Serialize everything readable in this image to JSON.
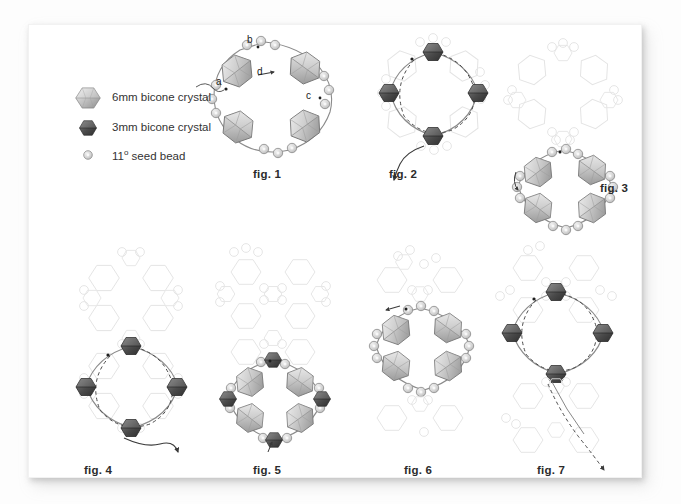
{
  "page": {
    "background_color": "#fdfdfd",
    "sheet_color": "#ffffff"
  },
  "legend": {
    "items": [
      {
        "icon": "bicone-crystal-6mm-icon",
        "label": "6mm bicone crystal",
        "color": "#9a9a9a",
        "size": "6mm"
      },
      {
        "icon": "bicone-crystal-3mm-icon",
        "label": "3mm bicone crystal",
        "color": "#4a4a4a",
        "size": "3mm"
      },
      {
        "icon": "seed-bead-icon",
        "label_prefix": "11",
        "label_sup": "o",
        "label_suffix": " seed bead",
        "label": "11º seed bead",
        "color": "#c9c9c9",
        "size": "11/0"
      }
    ]
  },
  "figures": [
    {
      "id": "fig1",
      "label": "fig. 1",
      "points": [
        {
          "name": "a",
          "text": "a"
        },
        {
          "name": "b",
          "text": "b"
        },
        {
          "name": "c",
          "text": "c"
        },
        {
          "name": "d",
          "text": "d"
        }
      ],
      "crystals_6mm": 4,
      "crystals_3mm": 0,
      "seed_beads": 12,
      "ghost_rounds": 0
    },
    {
      "id": "fig2",
      "label": "fig. 2",
      "points": [],
      "crystals_6mm": 0,
      "crystals_3mm": 4,
      "seed_beads": 0,
      "ghost_rounds": 1
    },
    {
      "id": "fig3",
      "label": "fig. 3",
      "points": [],
      "crystals_6mm": 4,
      "crystals_3mm": 0,
      "seed_beads": 12,
      "ghost_rounds": 2
    },
    {
      "id": "fig4",
      "label": "fig. 4",
      "points": [],
      "crystals_6mm": 0,
      "crystals_3mm": 4,
      "seed_beads": 0,
      "ghost_rounds": 3
    },
    {
      "id": "fig5",
      "label": "fig. 5",
      "points": [],
      "crystals_6mm": 4,
      "crystals_3mm": 4,
      "seed_beads": 12,
      "ghost_rounds": 4
    },
    {
      "id": "fig6",
      "label": "fig. 6",
      "points": [],
      "crystals_6mm": 4,
      "crystals_3mm": 0,
      "seed_beads": 12,
      "ghost_rounds": 5
    },
    {
      "id": "fig7",
      "label": "fig. 7",
      "points": [],
      "crystals_6mm": 0,
      "crystals_3mm": 4,
      "seed_beads": 0,
      "ghost_rounds": 6
    }
  ],
  "colors": {
    "crystal_6mm_light": "#e8e8e8",
    "crystal_6mm_mid": "#b4b4b4",
    "crystal_6mm_dark": "#8a8a8a",
    "crystal_3mm_light": "#6f6f6f",
    "crystal_3mm_dark": "#3b3b3b",
    "seed_bead_fill": "#d6d6d6",
    "seed_bead_stroke": "#9c9c9c",
    "ghost_stroke": "#e3e3e3",
    "thread": "#555555",
    "text": "#2b2b2b"
  }
}
